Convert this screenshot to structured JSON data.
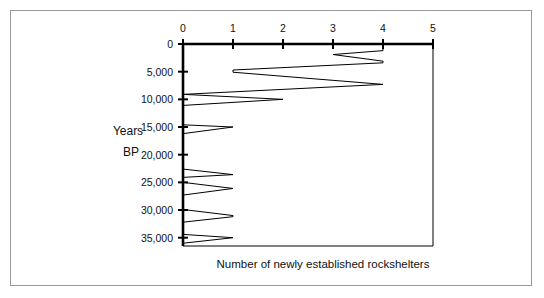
{
  "figure": {
    "border_color": "#9a9a9a",
    "background": "#ffffff",
    "line_color": "#000000",
    "axis_color": "#000000"
  },
  "chart_data": {
    "type": "line",
    "title": "",
    "subtitle": "",
    "xlabel": "Number of newly established rockshelters",
    "ylabel": "Years BP",
    "ylabel_lines": [
      "Years",
      "BP"
    ],
    "orientation": "horizontal-value-vertical-time",
    "grid": false,
    "legend": false,
    "legend_position": "none",
    "xlim": [
      0,
      5
    ],
    "ylim": [
      0,
      36500
    ],
    "y_axis_inverted": true,
    "x_ticks": [
      0,
      1,
      2,
      3,
      4,
      5
    ],
    "x_tick_labels": [
      "0",
      "1",
      "2",
      "3",
      "4",
      "5"
    ],
    "y_ticks": [
      0,
      5000,
      10000,
      15000,
      20000,
      25000,
      30000,
      35000
    ],
    "y_tick_labels": [
      "0",
      "5,000",
      "10,000",
      "15,000",
      "20,000",
      "25,000",
      "30,000",
      "35,000"
    ],
    "x_axis_position": "top",
    "y_axis_position": "left",
    "series": [
      {
        "name": "Newly established rockshelters",
        "x_label": "Number of newly established rockshelters",
        "y_label": "Years BP",
        "points": [
          {
            "years_bp": 0,
            "count": 0
          },
          {
            "years_bp": 0,
            "count": 4
          },
          {
            "years_bp": 1200,
            "count": 4
          },
          {
            "years_bp": 1900,
            "count": 3
          },
          {
            "years_bp": 3100,
            "count": 4
          },
          {
            "years_bp": 3400,
            "count": 4
          },
          {
            "years_bp": 4700,
            "count": 1
          },
          {
            "years_bp": 5100,
            "count": 1
          },
          {
            "years_bp": 7300,
            "count": 4
          },
          {
            "years_bp": 9100,
            "count": 0
          },
          {
            "years_bp": 10000,
            "count": 2
          },
          {
            "years_bp": 11100,
            "count": 0
          },
          {
            "years_bp": 14600,
            "count": 0
          },
          {
            "years_bp": 15000,
            "count": 1
          },
          {
            "years_bp": 16200,
            "count": 0
          },
          {
            "years_bp": 22600,
            "count": 0
          },
          {
            "years_bp": 23600,
            "count": 1
          },
          {
            "years_bp": 24100,
            "count": 0
          },
          {
            "years_bp": 25000,
            "count": 0
          },
          {
            "years_bp": 26100,
            "count": 1
          },
          {
            "years_bp": 27300,
            "count": 0
          },
          {
            "years_bp": 29900,
            "count": 0
          },
          {
            "years_bp": 31000,
            "count": 1
          },
          {
            "years_bp": 31200,
            "count": 1
          },
          {
            "years_bp": 32200,
            "count": 0
          },
          {
            "years_bp": 34400,
            "count": 0
          },
          {
            "years_bp": 35000,
            "count": 1
          },
          {
            "years_bp": 36000,
            "count": 0
          },
          {
            "years_bp": 36500,
            "count": 0
          }
        ]
      }
    ]
  }
}
